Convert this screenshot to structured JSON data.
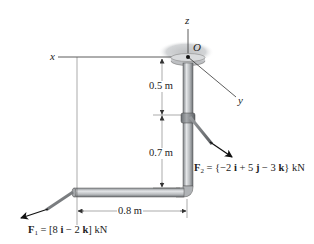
{
  "diagram": {
    "type": "statics-pipe-assembly",
    "axes": {
      "x_label": "x",
      "y_label": "y",
      "z_label": "z",
      "origin_label": "O"
    },
    "dimensions": {
      "upper_vertical": "0.5 m",
      "lower_vertical": "0.7 m",
      "horizontal": "0.8 m"
    },
    "forces": [
      {
        "name": "F1",
        "symbol": "F",
        "subscript": "1",
        "expression": "= [8 i − 2 k] kN",
        "prefix": " = [8 ",
        "i": "i",
        "mid": " − 2 ",
        "k": "k",
        "suffix": "] kN"
      },
      {
        "name": "F2",
        "symbol": "F",
        "subscript": "2",
        "expression": "= {−2 i + 5 j − 3 k} kN",
        "prefix": " = {−2 ",
        "i": "i",
        "mid1": " + 5 ",
        "j": "j",
        "mid2": " − 3 ",
        "k": "k",
        "suffix": "} kN"
      }
    ],
    "colors": {
      "pipe_fill": "#b9bcbf",
      "pipe_dark": "#7d8185",
      "pipe_highlight": "#e4e6e8",
      "ceiling_shade": "#c9cbcd",
      "line": "#333333",
      "arrow": "#111111"
    }
  }
}
